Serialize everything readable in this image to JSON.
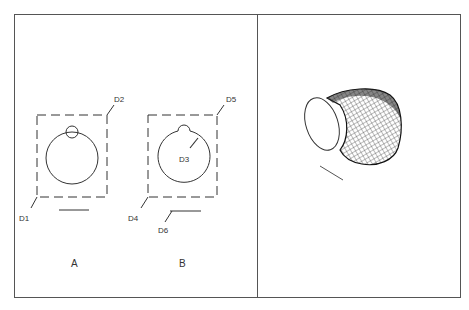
{
  "figure": {
    "left_panel": {
      "views": [
        {
          "label": "A",
          "callouts": [
            "D1",
            "D2"
          ]
        },
        {
          "label": "B",
          "callouts": [
            "D3",
            "D4",
            "D5",
            "D6"
          ]
        }
      ]
    },
    "right_panel": {
      "description": "3D meshed curved pipe elbow surface"
    },
    "labels": {
      "A": "A",
      "B": "B",
      "D1": "D1",
      "D2": "D2",
      "D3": "D3",
      "D4": "D4",
      "D5": "D5",
      "D6": "D6"
    },
    "colors": {
      "stroke": "#333333",
      "background": "#ffffff"
    }
  }
}
